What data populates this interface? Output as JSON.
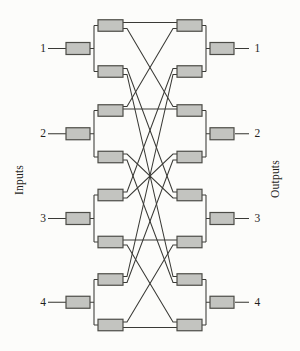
{
  "figure": {
    "left_axis_label": "Inputs",
    "right_axis_label": "Outputs",
    "input_labels": [
      "1",
      "2",
      "3",
      "4"
    ],
    "output_labels": [
      "1",
      "2",
      "3",
      "4"
    ]
  },
  "colors": {
    "bg": "#fcfcfa",
    "box_fill": "#c3c4c0",
    "box_stroke": "#4c4c47",
    "wire": "#3a3a36",
    "text": "#1f1f1d"
  },
  "network": {
    "mid_rows": [
      25.5,
      71.5,
      110.5,
      157,
      195,
      242,
      279.5,
      325
    ],
    "io_rows": [
      48.5,
      133.75,
      218.5,
      302.25
    ],
    "edges": [
      [
        1,
        1,
        -3,
        -3
      ],
      [
        1,
        3,
        3,
        -4
      ],
      [
        2,
        5,
        -3,
        -3
      ],
      [
        2,
        7,
        3,
        -3
      ],
      [
        3,
        1,
        -4,
        3
      ],
      [
        3,
        3,
        -1.5,
        -1.5
      ],
      [
        4,
        5,
        -3,
        3
      ],
      [
        4,
        7,
        3,
        3
      ],
      [
        5,
        2,
        -3,
        -3
      ],
      [
        5,
        4,
        3,
        -3
      ],
      [
        6,
        6,
        -2,
        -2
      ],
      [
        6,
        8,
        3,
        -3
      ],
      [
        7,
        2,
        -3,
        3
      ],
      [
        7,
        4,
        3,
        3
      ],
      [
        8,
        6,
        -3,
        3
      ],
      [
        8,
        8,
        2.5,
        2.5
      ]
    ],
    "geometry": {
      "in_box": {
        "x": 66,
        "w": 24,
        "h": 12
      },
      "out_box": {
        "x": 210,
        "w": 24,
        "h": 12
      },
      "s2_box": {
        "x": 98,
        "w": 25,
        "h": 11.5
      },
      "s3_box": {
        "x": 177,
        "w": 25,
        "h": 11.5
      },
      "bracket_left_x": 94,
      "bracket_right_x": 206,
      "label_line_left": [
        48,
        66
      ],
      "label_line_right": [
        235,
        249
      ],
      "stub": 4
    }
  }
}
